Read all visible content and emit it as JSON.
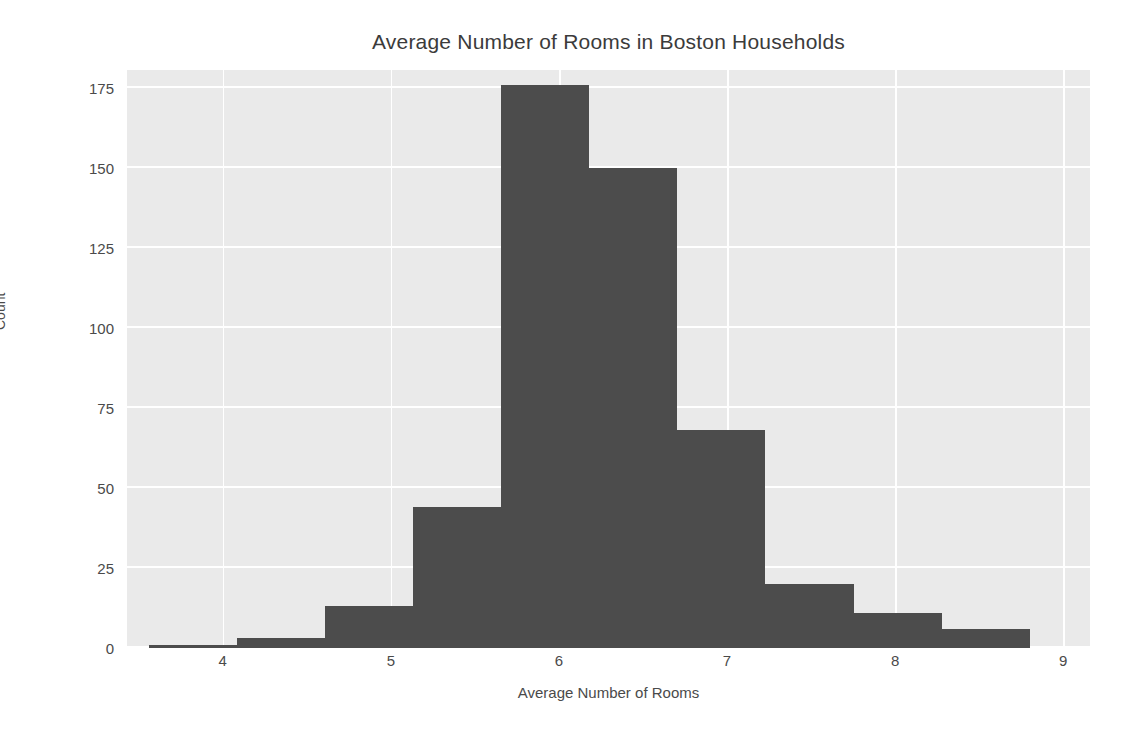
{
  "chart_data": {
    "type": "bar",
    "title": "Average Number of Rooms in Boston Households",
    "xlabel": "Average Number of Rooms",
    "ylabel": "Count",
    "xlim": [
      3.43,
      9.16
    ],
    "ylim": [
      0,
      180.6
    ],
    "grid": true,
    "legend": null,
    "style": "seaborn-darkgrid",
    "bar_color": "#4c4c4c",
    "plot_background": "#eaeaea",
    "grid_color": "#ffffff",
    "text_color": "#4a4a4a",
    "xticks": [
      4,
      5,
      6,
      7,
      8,
      9
    ],
    "xtick_labels": [
      "4",
      "5",
      "6",
      "7",
      "8",
      "9"
    ],
    "yticks": [
      0,
      25,
      50,
      75,
      100,
      125,
      150,
      175
    ],
    "ytick_labels": [
      "0",
      "25",
      "50",
      "75",
      "100",
      "125",
      "150",
      "175"
    ],
    "bin_edges": [
      3.561,
      4.085,
      4.609,
      5.133,
      5.657,
      6.181,
      6.705,
      7.229,
      7.753,
      8.277,
      8.801
    ],
    "bin_centers": [
      3.82,
      4.35,
      4.87,
      5.4,
      5.92,
      6.44,
      6.97,
      7.49,
      8.02,
      8.54
    ],
    "values": [
      1,
      3,
      13,
      44,
      176,
      150,
      68,
      20,
      11,
      6
    ],
    "categories": [
      "3.56-4.09",
      "4.09-4.61",
      "4.61-5.13",
      "5.13-5.66",
      "5.66-6.18",
      "6.18-6.71",
      "6.71-7.23",
      "7.23-7.75",
      "7.75-8.28",
      "8.28-8.80"
    ]
  }
}
